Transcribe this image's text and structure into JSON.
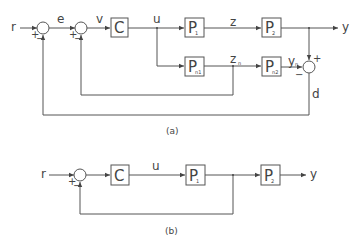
{
  "diagram_a": {
    "caption": "(a)",
    "signals": {
      "r": "r",
      "e": "e",
      "v": "v",
      "u": "u",
      "z": "z",
      "y": "y",
      "zn": "z",
      "zn_sub": "n",
      "yn": "y",
      "yn_sub": "n",
      "d": "d"
    },
    "blocks": {
      "controller": "C",
      "p1": "P",
      "p1_sub": "1",
      "p2": "P",
      "p2_sub": "2",
      "pn1": "P",
      "pn1_sub": "n1",
      "pn2": "P",
      "pn2_sub": "n2"
    },
    "signs": {
      "sum1_plus": "+",
      "sum1_minus": "−",
      "sum2_plus": "+",
      "sum2_minus": "−",
      "sum3_plus": "+",
      "sum3_minus": "−"
    }
  },
  "diagram_b": {
    "caption": "(b)",
    "signals": {
      "r": "r",
      "u": "u",
      "y": "y"
    },
    "blocks": {
      "controller": "C",
      "p1": "P",
      "p1_sub": "1",
      "p2": "P",
      "p2_sub": "2"
    },
    "signs": {
      "sum_plus": "+",
      "sum_minus": "−"
    }
  }
}
